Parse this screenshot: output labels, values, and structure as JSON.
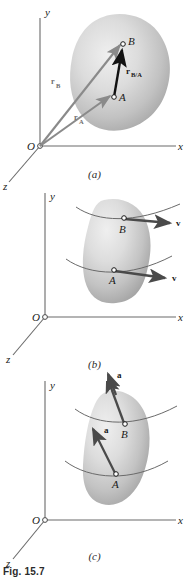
{
  "figure": {
    "number": "Fig. 15.7",
    "domain": "kinematics-rigid-body-diagram",
    "panels": [
      {
        "id": "a",
        "caption": "(a)",
        "axes": {
          "x": "x",
          "y": "y",
          "z": "z",
          "origin": "O"
        },
        "points": [
          "A",
          "B"
        ],
        "vectors": [
          {
            "name": "r_A",
            "base": "r",
            "subscript": "A",
            "label": "r",
            "from": "O",
            "to": "A",
            "color": "#8a8a8a"
          },
          {
            "name": "r_B",
            "base": "r",
            "subscript": "B",
            "label": "r",
            "from": "O",
            "to": "B",
            "color": "#8a8a8a"
          },
          {
            "name": "r_B/A",
            "base": "r",
            "subscript": "B/A",
            "label": "r",
            "from": "A",
            "to": "B",
            "color": "#111111"
          }
        ]
      },
      {
        "id": "b",
        "caption": "(b)",
        "axes": {
          "x": "x",
          "y": "y",
          "z": "z",
          "origin": "O"
        },
        "points": [
          "A",
          "B"
        ],
        "vectors": [
          {
            "name": "v_B",
            "base": "v",
            "subscript": "",
            "label": "v",
            "from": "B",
            "color": "#4a4a4a"
          },
          {
            "name": "v_A",
            "base": "v",
            "subscript": "",
            "label": "v",
            "from": "A",
            "color": "#4a4a4a"
          }
        ]
      },
      {
        "id": "c",
        "caption": "(c)",
        "axes": {
          "x": "x",
          "y": "y",
          "z": "z",
          "origin": "O"
        },
        "points": [
          "A",
          "B"
        ],
        "vectors": [
          {
            "name": "a_B",
            "base": "a",
            "subscript": "",
            "label": "a",
            "from": "B",
            "color": "#4a4a4a"
          },
          {
            "name": "a_A",
            "base": "a",
            "subscript": "",
            "label": "a",
            "from": "A",
            "color": "#4a4a4a"
          }
        ]
      }
    ],
    "colors": {
      "axis": "#6a6a6a",
      "body_fill_light": "#e3e3e3",
      "body_fill_mid": "#c9c9c9",
      "body_fill_dark": "#a9a9a9",
      "vector_gray": "#8a8a8a",
      "vector_dark": "#4a4a4a",
      "vector_black": "#111111",
      "text": "#1a1a1a",
      "background": "#ffffff"
    }
  },
  "labels": {
    "x": "x",
    "y": "y",
    "z": "z",
    "O": "O",
    "A": "A",
    "B": "B",
    "r": "r",
    "v": "v",
    "a": "a",
    "sub_A": "A",
    "sub_B": "B",
    "sub_BA": "B/A",
    "cap_a": "(a)",
    "cap_b": "(b)",
    "cap_c": "(c)",
    "fig": "Fig. 15.7"
  }
}
